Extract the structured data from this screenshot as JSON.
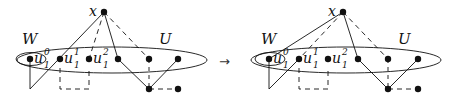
{
  "figure": {
    "arrow": "→",
    "colors": {
      "ink": "#111111",
      "background": "#ffffff"
    },
    "left_graph": {
      "label_x": "x",
      "label_W": "W",
      "label_U": "U",
      "vertices": [
        {
          "id": "u10",
          "base": "u",
          "sub": "1",
          "sup": "0"
        },
        {
          "id": "u11",
          "base": "u",
          "sub": "1",
          "sup": "1"
        },
        {
          "id": "u12",
          "base": "u",
          "sub": "1",
          "sup": "2"
        }
      ]
    },
    "right_graph": {
      "label_x": "x",
      "label_W": "W",
      "label_U": "U",
      "vertices": [
        {
          "id": "u10",
          "base": "u",
          "sub": "1",
          "sup": "0"
        },
        {
          "id": "u11",
          "base": "u",
          "sub": "1",
          "sup": "1"
        },
        {
          "id": "u12",
          "base": "u",
          "sub": "1",
          "sup": "2"
        }
      ]
    }
  }
}
